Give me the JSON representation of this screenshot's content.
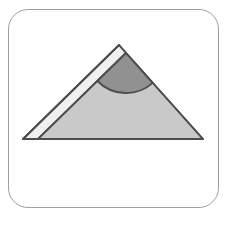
{
  "card": {
    "background": "#ffffff",
    "border_color": "#9e9e9e",
    "border_radius_px": 20
  },
  "figure": {
    "name": "triangle-with-shaded-apex-angle",
    "colors": {
      "outline": "#4d4d4d",
      "band_fill": "#f0f0f0",
      "triangle_fill": "#c9c9c9",
      "sector_fill": "#919191"
    },
    "geometry": {
      "outer_triangle_points": "119,45 203,139 23,139",
      "band_points": "119,45 126,53 38,139 23,139",
      "inner_triangle_points": "126,53 203,139 38,139",
      "sector_path": "M 126,53 L 97.4,81 A 40,40 0 0 0 152.7,82.8 Z",
      "stroke_width": "1.8"
    }
  }
}
